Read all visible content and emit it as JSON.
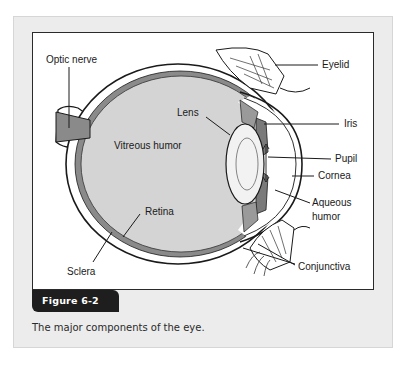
{
  "figure": {
    "tag": "Figure 6-2",
    "caption": "The major components of the eye."
  },
  "diagram": {
    "labels": {
      "optic_nerve": "Optic nerve",
      "eyelid": "Eyelid",
      "lens": "Lens",
      "iris": "Iris",
      "vitreous_humor": "Vitreous humor",
      "pupil": "Pupil",
      "cornea": "Cornea",
      "aqueous_humor_line1": "Aqueous",
      "aqueous_humor_line2": "humor",
      "retina": "Retina",
      "sclera": "Sclera",
      "conjunctiva": "Conjunctiva"
    },
    "colors": {
      "vitreous_fill": "#d4d4d4",
      "tissue_dark": "#7a7a7a",
      "outline": "#1a1a1a",
      "panel_bg": "#ececec",
      "tag_bg": "#1e1e1e"
    }
  }
}
